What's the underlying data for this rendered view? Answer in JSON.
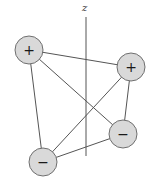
{
  "diagram": {
    "axis": {
      "label": "z",
      "x": 86,
      "y_top": 17,
      "y_bottom": 156,
      "label_x": 85,
      "label_y": 11,
      "color": "#555555"
    },
    "colors": {
      "charge_fill": "#d9d9d9",
      "charge_stroke": "#6f6f6f",
      "edge": "#555555"
    },
    "charges": [
      {
        "id": "top-left",
        "sign": "+",
        "x": 29,
        "y": 50,
        "r": 14
      },
      {
        "id": "right",
        "sign": "+",
        "x": 131,
        "y": 67,
        "r": 14
      },
      {
        "id": "lower-right",
        "sign": "−",
        "x": 123,
        "y": 134,
        "r": 14
      },
      {
        "id": "lower-left",
        "sign": "−",
        "x": 43,
        "y": 162,
        "r": 14
      }
    ],
    "edges": [
      [
        "top-left",
        "right"
      ],
      [
        "top-left",
        "lower-right"
      ],
      [
        "top-left",
        "lower-left"
      ],
      [
        "right",
        "lower-right"
      ],
      [
        "right",
        "lower-left"
      ],
      [
        "lower-right",
        "lower-left"
      ]
    ]
  }
}
